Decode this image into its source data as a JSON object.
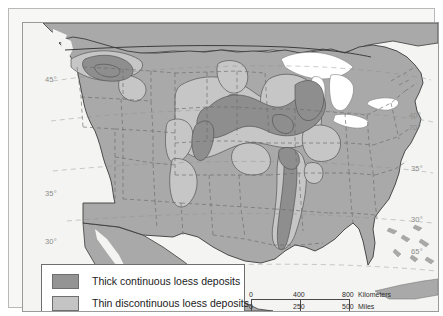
{
  "figure": {
    "kind": "thematic-map"
  },
  "legend": {
    "items": [
      {
        "label": "Thick continuous loess deposits",
        "color": "#949494",
        "swatch_name": "thick-loess-swatch"
      },
      {
        "label": "Thin discontinuous loess deposits",
        "color": "#c4c4c4",
        "swatch_name": "thin-loess-swatch"
      }
    ]
  },
  "scalebar": {
    "km": {
      "ticks": [
        "0",
        "400",
        "800"
      ],
      "unit": "Kilometers"
    },
    "mi": {
      "ticks": [
        "0",
        "250",
        "500"
      ],
      "unit": "Miles"
    }
  },
  "graticule": {
    "left_labels": [
      {
        "text": "45°",
        "x": 22,
        "y": 52
      },
      {
        "text": "35°",
        "x": 22,
        "y": 166
      },
      {
        "text": "30°",
        "x": 22,
        "y": 214
      }
    ],
    "right_labels": [
      {
        "text": "40°",
        "x": 404,
        "y": 92
      },
      {
        "text": "70°",
        "x": 404,
        "y": 104
      },
      {
        "text": "35°",
        "x": 406,
        "y": 145
      },
      {
        "text": "30°",
        "x": 406,
        "y": 196
      },
      {
        "text": "65°",
        "x": 406,
        "y": 228
      }
    ]
  },
  "colors": {
    "ocean": "#f4f4f2",
    "land": "#a9a9a9",
    "thick_loess": "#8e8e8e",
    "thin_loess": "#c6c6c6",
    "lakes": "#ffffff",
    "state_border": "#6b6b6b",
    "country_border": "#3c3c3c",
    "deposit_outline": "#555555",
    "frame": "#9a9a9a"
  }
}
